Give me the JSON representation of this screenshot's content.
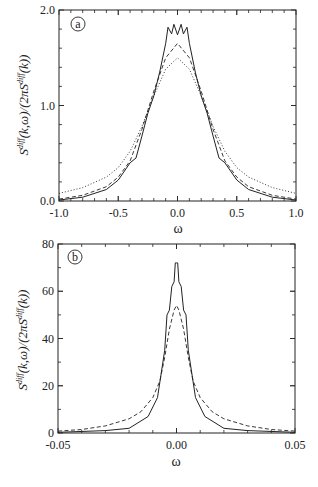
{
  "chart_data": [
    {
      "type": "line",
      "panel": "a",
      "xlabel": "ω",
      "ylabel": "S^diff(k,ω)/(2πS^diff(k))",
      "xlim": [
        -1.0,
        1.0
      ],
      "ylim": [
        0.0,
        2.0
      ],
      "xticks": [
        "-1.0",
        "-0.5",
        "0.0",
        "0.5",
        "1.0"
      ],
      "yticks": [
        "0.0",
        "1.0",
        "2.0"
      ],
      "grid": false,
      "series": [
        {
          "name": "solid",
          "style": "solid",
          "x": [
            -1.0,
            -0.8,
            -0.6,
            -0.5,
            -0.4,
            -0.35,
            -0.3,
            -0.25,
            -0.2,
            -0.15,
            -0.1,
            -0.08,
            -0.05,
            -0.03,
            0.0,
            0.03,
            0.05,
            0.08,
            0.1,
            0.15,
            0.2,
            0.25,
            0.3,
            0.35,
            0.4,
            0.5,
            0.6,
            0.8,
            1.0
          ],
          "values": [
            0.01,
            0.04,
            0.12,
            0.22,
            0.4,
            0.45,
            0.68,
            0.92,
            1.1,
            1.35,
            1.65,
            1.82,
            1.75,
            1.85,
            1.74,
            1.85,
            1.75,
            1.82,
            1.65,
            1.35,
            1.1,
            0.92,
            0.68,
            0.45,
            0.4,
            0.22,
            0.12,
            0.04,
            0.01
          ]
        },
        {
          "name": "dashed",
          "style": "dashed",
          "x": [
            -1.0,
            -0.8,
            -0.6,
            -0.5,
            -0.4,
            -0.3,
            -0.2,
            -0.1,
            0.0,
            0.1,
            0.2,
            0.3,
            0.4,
            0.5,
            0.6,
            0.8,
            1.0
          ],
          "values": [
            0.02,
            0.06,
            0.15,
            0.25,
            0.42,
            0.75,
            1.15,
            1.5,
            1.65,
            1.5,
            1.15,
            0.75,
            0.42,
            0.25,
            0.15,
            0.06,
            0.02
          ]
        },
        {
          "name": "dotted",
          "style": "dotted",
          "x": [
            -1.0,
            -0.8,
            -0.6,
            -0.5,
            -0.4,
            -0.3,
            -0.2,
            -0.1,
            0.0,
            0.1,
            0.2,
            0.3,
            0.4,
            0.5,
            0.6,
            0.8,
            1.0
          ],
          "values": [
            0.08,
            0.14,
            0.25,
            0.35,
            0.52,
            0.78,
            1.1,
            1.38,
            1.5,
            1.38,
            1.1,
            0.78,
            0.52,
            0.35,
            0.25,
            0.14,
            0.08
          ]
        }
      ]
    },
    {
      "type": "line",
      "panel": "b",
      "xlabel": "ω",
      "ylabel": "S^diff(k,ω)/(2πS^diff(k))",
      "xlim": [
        -0.05,
        0.05
      ],
      "ylim": [
        0,
        80
      ],
      "xticks": [
        "-0.05",
        "0.00",
        "0.05"
      ],
      "yticks": [
        "0",
        "20",
        "40",
        "60",
        "80"
      ],
      "grid": false,
      "series": [
        {
          "name": "solid",
          "style": "solid",
          "x": [
            -0.05,
            -0.03,
            -0.02,
            -0.012,
            -0.008,
            -0.005,
            -0.004,
            -0.003,
            -0.002,
            -0.001,
            -0.0005,
            0.0,
            0.0005,
            0.001,
            0.002,
            0.003,
            0.004,
            0.005,
            0.008,
            0.012,
            0.02,
            0.03,
            0.05
          ],
          "values": [
            0.3,
            1.0,
            2.0,
            7.0,
            15.0,
            35.0,
            50.0,
            52.0,
            62.0,
            64.0,
            72.0,
            72.0,
            72.0,
            64.0,
            62.0,
            52.0,
            50.0,
            35.0,
            15.0,
            7.0,
            2.0,
            1.0,
            0.3
          ]
        },
        {
          "name": "dashed",
          "style": "dashed",
          "x": [
            -0.05,
            -0.04,
            -0.03,
            -0.02,
            -0.015,
            -0.01,
            -0.007,
            -0.005,
            -0.003,
            -0.001,
            0.0,
            0.001,
            0.003,
            0.005,
            0.007,
            0.01,
            0.015,
            0.02,
            0.03,
            0.04,
            0.05
          ],
          "values": [
            0.8,
            1.5,
            3.0,
            6.0,
            9.0,
            15.0,
            22.0,
            32.0,
            44.0,
            52.0,
            54.0,
            52.0,
            44.0,
            32.0,
            22.0,
            15.0,
            9.0,
            6.0,
            3.0,
            1.5,
            0.8
          ]
        }
      ]
    }
  ],
  "panels": {
    "a": {
      "letter": "a",
      "xlabel": "ω",
      "ylabel_main": "S",
      "ylabel_sup": "diff",
      "ylabel_mid": "(k,ω)/(2πS",
      "ylabel_sup2": "diff",
      "ylabel_end": "(k))",
      "xticks": [
        "-1.0",
        "-0.5",
        "0.0",
        "0.5",
        "1.0"
      ],
      "yticks": [
        "0.0",
        "1.0",
        "2.0"
      ]
    },
    "b": {
      "letter": "b",
      "xlabel": "ω",
      "ylabel_main": "S",
      "ylabel_sup": "diff",
      "ylabel_mid": "(k,ω)/(2πS",
      "ylabel_sup2": "diff",
      "ylabel_end": "(k))",
      "xticks": [
        "-0.05",
        "0.00",
        "0.05"
      ],
      "yticks": [
        "0",
        "20",
        "40",
        "60",
        "80"
      ]
    }
  }
}
